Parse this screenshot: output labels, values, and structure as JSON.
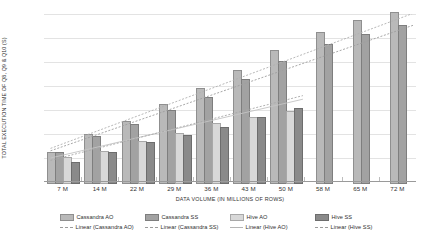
{
  "chart_data": {
    "type": "bar",
    "title": "",
    "xlabel": "DATA VOLUME (IN MILLIONS OF ROWS)",
    "ylabel": "TOTAL EXECUTION TIME OF Q8, Q9 & Q10 (S)",
    "ylim": [
      0,
      140
    ],
    "yticks": [
      0,
      20,
      40,
      60,
      80,
      100,
      120,
      140
    ],
    "grid": true,
    "legend_position": "bottom",
    "categories": [
      "7 M",
      "14 M",
      "22 M",
      "29 M",
      "36 M",
      "43 M",
      "50 M",
      "58 M",
      "65 M",
      "72 M"
    ],
    "series": [
      {
        "name": "Cassandra AO",
        "color": "#b9b9b9",
        "values": [
          25,
          40,
          51,
          65,
          78,
          93,
          110,
          125,
          135,
          142
        ]
      },
      {
        "name": "Cassandra SS",
        "color": "#a2a2a2",
        "values": [
          25,
          38,
          48,
          60,
          71,
          86,
          101,
          115,
          123,
          131
        ]
      },
      {
        "name": "Hive AO",
        "color": "#d8d8d8",
        "values": [
          21,
          26,
          34,
          41,
          49,
          54,
          59,
          null,
          null,
          null
        ]
      },
      {
        "name": "Hive SS",
        "color": "#8a8a8a",
        "values": [
          17,
          25,
          33,
          39,
          46,
          54,
          62,
          null,
          null,
          null
        ]
      }
    ],
    "trendlines": [
      {
        "name": "Linear (Cassandra AO)",
        "style": "dashed",
        "color": "#b0b0b0",
        "y_start": 28,
        "y_end": 141
      },
      {
        "name": "Linear (Cassandra SS)",
        "style": "dashed",
        "color": "#9e9e9e",
        "y_start": 26,
        "y_end": 131
      },
      {
        "name": "Linear (Hive AO)",
        "style": "solid",
        "color": "#c4c4c4",
        "y_start": 20,
        "y_end": 69
      },
      {
        "name": "Linear (Hive SS)",
        "style": "dashed",
        "color": "#a8a8a8",
        "y_start": 18,
        "y_end": 72
      }
    ]
  },
  "legend": {
    "row1": [
      {
        "label": "Cassandra AO",
        "swatch": "series-swatch-cassandra-ao"
      },
      {
        "label": "Cassandra SS",
        "swatch": "series-swatch-cassandra-ss"
      },
      {
        "label": "Hive AO",
        "swatch": "series-swatch-hive-ao"
      },
      {
        "label": "Hive SS",
        "swatch": "series-swatch-hive-ss"
      }
    ],
    "row2": [
      {
        "label": "Linear (Cassandra AO)",
        "swatch": "trendline-swatch-cassandra-ao"
      },
      {
        "label": "Linear (Cassandra SS)",
        "swatch": "trendline-swatch-cassandra-ss"
      },
      {
        "label": "Linear (Hive AO)",
        "swatch": "trendline-swatch-hive-ao"
      },
      {
        "label": "Linear (Hive SS)",
        "swatch": "trendline-swatch-hive-ss"
      }
    ]
  }
}
